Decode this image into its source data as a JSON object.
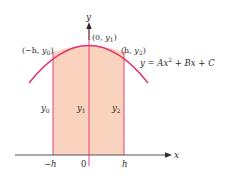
{
  "figure": {
    "colors": {
      "curve": "#e0306a",
      "fill": "#f9d3be",
      "bar_lines": "#e0306a",
      "axes": "#2b2b2b",
      "text": "#2b2b2b"
    },
    "axes": {
      "x_label": "x",
      "y_label": "y",
      "origin_label": "0"
    },
    "x_ticks": [
      {
        "label": "−h"
      },
      {
        "label": "0"
      },
      {
        "label": "h"
      }
    ],
    "points": [
      {
        "label": "(−h, y₀)"
      },
      {
        "label": "(0, y₁)"
      },
      {
        "label": "(h, y₂)"
      }
    ],
    "heights": [
      {
        "label": "y",
        "sub": "0"
      },
      {
        "label": "y",
        "sub": "1"
      },
      {
        "label": "y",
        "sub": "2"
      }
    ],
    "equation": {
      "prefix": "y = Ax",
      "sup": "2",
      "suffix": " + Bx + C"
    },
    "point_labels": {
      "left": {
        "open": "(−h, ",
        "var": "y",
        "sub": "0",
        "close": ")"
      },
      "mid": {
        "open": "(0, ",
        "var": "y",
        "sub": "1",
        "close": ")"
      },
      "right": {
        "open": "(h, ",
        "var": "y",
        "sub": "2",
        "close": ")"
      }
    }
  }
}
